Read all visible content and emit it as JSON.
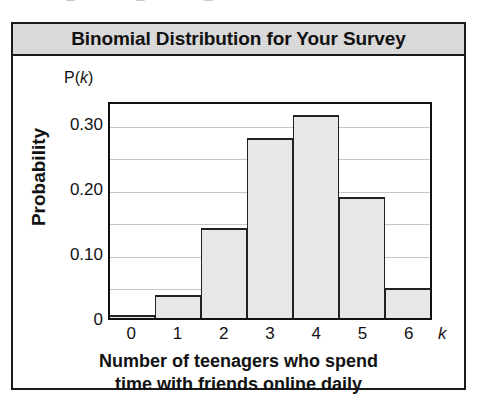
{
  "figure": {
    "title": "Binomial Distribution for Your Survey",
    "caption_line1": "Number of teenagers who spend",
    "caption_line2": "time with friends online daily",
    "axis_variable_label": "k",
    "probability_header_prefix": "P(",
    "probability_header_var": "k",
    "probability_header_suffix": ")",
    "ylabel": "Probability"
  },
  "colors": {
    "title_band": "#d9d9d9",
    "bar_fill": "#e7e7e7",
    "bar_edge": "#222222",
    "gridline": "#c6c6c6",
    "frame": "#1a1a1a",
    "text": "#121212"
  },
  "chart_data": {
    "type": "bar",
    "title": "Binomial Distribution for Your Survey",
    "xlabel": "Number of teenagers who spend time with friends online daily",
    "ylabel": "Probability",
    "categories": [
      "0",
      "1",
      "2",
      "3",
      "4",
      "5",
      "6"
    ],
    "values": [
      0.004,
      0.035,
      0.138,
      0.276,
      0.312,
      0.186,
      0.046
    ],
    "x_tick_labels": [
      "0",
      "1",
      "2",
      "3",
      "4",
      "5",
      "6"
    ],
    "y_tick_labels": [
      "0.30",
      "0.20",
      "0.10",
      "0"
    ],
    "y_tick_values": [
      0.3,
      0.2,
      0.1,
      0
    ],
    "gridline_values": [
      0.3,
      0.25,
      0.2,
      0.15,
      0.1,
      0.05
    ],
    "ylim": [
      0,
      0.335
    ],
    "xlim": [
      -0.5,
      6.5
    ],
    "grid": true,
    "legend": "none",
    "axis_variable": "k",
    "series_name": "P(k)"
  }
}
